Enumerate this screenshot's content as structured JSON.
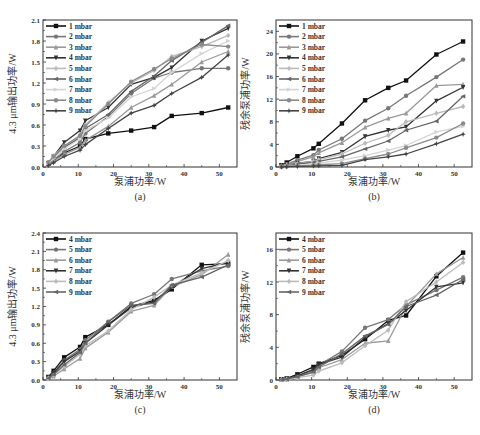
{
  "chart_data": [
    {
      "id": "a",
      "type": "line",
      "panel_label": "(a)",
      "xlabel": "泵浦功率/W",
      "ylabel": "4.3 μm输出功率/W",
      "xlim": [
        0,
        55
      ],
      "ylim": [
        0,
        2.1
      ],
      "xticks": [
        0,
        10,
        20,
        30,
        40,
        50
      ],
      "yticks": [
        0.0,
        0.3,
        0.6,
        0.9,
        1.2,
        1.5,
        1.8,
        2.1
      ],
      "ytick_labels": [
        "0.0",
        "0.3",
        "0.6",
        "0.9",
        "1.2",
        "1.5",
        "1.8",
        "2.1"
      ],
      "legend_position": "top-left",
      "x": [
        1.5,
        3,
        6,
        10.5,
        12,
        18.5,
        25,
        31.5,
        36.5,
        45,
        52.5
      ],
      "series": [
        {
          "name": "1 mbar",
          "color": "#111111",
          "marker": "square",
          "values": [
            0.05,
            0.1,
            0.2,
            0.3,
            0.4,
            0.48,
            0.52,
            0.57,
            0.73,
            0.77,
            0.85
          ]
        },
        {
          "name": "2 mbar",
          "color": "#777777",
          "marker": "circle",
          "values": [
            0.04,
            0.1,
            0.22,
            0.35,
            0.48,
            0.72,
            1.05,
            1.27,
            1.35,
            1.41,
            1.41
          ]
        },
        {
          "name": "3 mbar",
          "color": "#999999",
          "marker": "triangle",
          "values": [
            0.03,
            0.08,
            0.18,
            0.28,
            0.38,
            0.58,
            0.85,
            1.02,
            1.18,
            1.5,
            1.65
          ]
        },
        {
          "name": "4 mbar",
          "color": "#333333",
          "marker": "triangle-down",
          "values": [
            0.05,
            0.15,
            0.35,
            0.52,
            0.66,
            0.85,
            1.18,
            1.28,
            1.42,
            1.8,
            1.98
          ]
        },
        {
          "name": "5 mbar",
          "color": "#bbbbbb",
          "marker": "diamond",
          "values": [
            0.06,
            0.16,
            0.3,
            0.45,
            0.6,
            0.92,
            1.2,
            1.38,
            1.58,
            1.72,
            1.88
          ]
        },
        {
          "name": "6 mbar",
          "color": "#666666",
          "marker": "left-triangle",
          "values": [
            0.05,
            0.13,
            0.28,
            0.42,
            0.55,
            0.75,
            1.08,
            1.3,
            1.52,
            1.78,
            2.02
          ]
        },
        {
          "name": "7 mbar",
          "color": "#d4d4d4",
          "marker": "right-triangle",
          "values": [
            0.05,
            0.12,
            0.26,
            0.4,
            0.52,
            0.7,
            1.0,
            1.12,
            1.35,
            1.62,
            1.8
          ]
        },
        {
          "name": "8 mbar",
          "color": "#8a8a8a",
          "marker": "hexagon",
          "values": [
            0.07,
            0.15,
            0.3,
            0.45,
            0.58,
            0.9,
            1.22,
            1.4,
            1.55,
            1.75,
            1.72
          ]
        },
        {
          "name": "9 mbar",
          "color": "#444444",
          "marker": "star",
          "values": [
            0.02,
            0.06,
            0.15,
            0.24,
            0.32,
            0.55,
            0.77,
            0.88,
            1.05,
            1.28,
            1.6
          ]
        }
      ]
    },
    {
      "id": "b",
      "type": "line",
      "panel_label": "(b)",
      "xlabel": "泵浦功率/W",
      "ylabel": "残余泵浦功率/W",
      "xlim": [
        0,
        55
      ],
      "ylim": [
        0,
        26
      ],
      "xticks": [
        0,
        10,
        20,
        30,
        40,
        50
      ],
      "yticks": [
        0,
        4,
        8,
        12,
        16,
        20,
        24
      ],
      "ytick_labels": [
        "0",
        "4",
        "8",
        "12",
        "16",
        "20",
        "24"
      ],
      "legend_position": "top-left",
      "x": [
        1.5,
        3,
        6,
        10.5,
        12,
        18.5,
        25,
        31.5,
        36.5,
        45,
        52.5
      ],
      "series": [
        {
          "name": "1 mbar",
          "color": "#111111",
          "marker": "square",
          "values": [
            0.3,
            0.8,
            1.9,
            3.3,
            4.1,
            7.7,
            11.8,
            14.0,
            15.3,
            19.9,
            22.2
          ]
        },
        {
          "name": "2 mbar",
          "color": "#777777",
          "marker": "circle",
          "values": [
            0.2,
            0.5,
            1.2,
            2.1,
            3.0,
            5.0,
            8.2,
            10.4,
            12.6,
            15.9,
            19.0
          ]
        },
        {
          "name": "3 mbar",
          "color": "#999999",
          "marker": "triangle",
          "values": [
            0.2,
            0.4,
            1.0,
            1.8,
            2.5,
            4.3,
            7.0,
            8.6,
            9.5,
            14.4,
            14.6
          ]
        },
        {
          "name": "4 mbar",
          "color": "#333333",
          "marker": "triangle-down",
          "values": [
            0.1,
            0.3,
            0.7,
            1.0,
            1.5,
            2.6,
            5.4,
            6.5,
            7.1,
            11.7,
            14.1
          ]
        },
        {
          "name": "5 mbar",
          "color": "#bbbbbb",
          "marker": "diamond",
          "values": [
            0.1,
            0.3,
            0.6,
            1.0,
            1.3,
            2.3,
            4.2,
            5.6,
            8.0,
            9.5,
            10.7
          ]
        },
        {
          "name": "6 mbar",
          "color": "#666666",
          "marker": "left-triangle",
          "values": [
            0.1,
            0.2,
            0.5,
            0.8,
            1.0,
            1.8,
            3.2,
            4.6,
            6.5,
            8.1,
            12.5
          ]
        },
        {
          "name": "7 mbar",
          "color": "#d4d4d4",
          "marker": "right-triangle",
          "values": [
            0.05,
            0.15,
            0.3,
            0.5,
            0.7,
            1.2,
            2.0,
            3.0,
            3.8,
            6.2,
            7.2
          ]
        },
        {
          "name": "8 mbar",
          "color": "#8a8a8a",
          "marker": "hexagon",
          "values": [
            0.05,
            0.1,
            0.2,
            0.3,
            0.4,
            0.6,
            1.5,
            2.3,
            3.4,
            5.2,
            7.7
          ]
        },
        {
          "name": "9 mbar",
          "color": "#444444",
          "marker": "star",
          "values": [
            0.0,
            0.05,
            0.1,
            0.15,
            0.2,
            0.3,
            1.3,
            1.8,
            2.3,
            4.1,
            5.8
          ]
        }
      ]
    },
    {
      "id": "c",
      "type": "line",
      "panel_label": "(c)",
      "xlabel": "泵浦功率/W",
      "ylabel": "4.3 μm输出功率/W",
      "xlim": [
        0,
        55
      ],
      "ylim": [
        0,
        2.4
      ],
      "xticks": [
        0,
        10,
        20,
        30,
        40,
        50
      ],
      "yticks": [
        0.0,
        0.3,
        0.6,
        0.9,
        1.2,
        1.5,
        1.8,
        2.1,
        2.4
      ],
      "ytick_labels": [
        "0.0",
        "0.3",
        "0.6",
        "0.9",
        "1.2",
        "1.5",
        "1.8",
        "2.1",
        "2.4"
      ],
      "legend_position": "top-left",
      "x": [
        1.5,
        3,
        6,
        10.5,
        12,
        18.5,
        25,
        31.5,
        36.5,
        45,
        52.5
      ],
      "series": [
        {
          "name": "4 mbar",
          "color": "#111111",
          "marker": "square",
          "values": [
            0.05,
            0.15,
            0.37,
            0.54,
            0.7,
            0.9,
            1.2,
            1.3,
            1.48,
            1.88,
            1.9
          ]
        },
        {
          "name": "5 mbar",
          "color": "#777777",
          "marker": "circle",
          "values": [
            0.04,
            0.12,
            0.32,
            0.5,
            0.65,
            0.95,
            1.25,
            1.4,
            1.65,
            1.78,
            1.86
          ]
        },
        {
          "name": "6 mbar",
          "color": "#999999",
          "marker": "triangle",
          "values": [
            0.02,
            0.06,
            0.18,
            0.35,
            0.52,
            0.78,
            1.12,
            1.22,
            1.52,
            1.72,
            2.05
          ]
        },
        {
          "name": "7 mbar",
          "color": "#333333",
          "marker": "triangle-down",
          "values": [
            0.04,
            0.11,
            0.3,
            0.47,
            0.6,
            0.9,
            1.18,
            1.28,
            1.52,
            1.82,
            1.92
          ]
        },
        {
          "name": "8 mbar",
          "color": "#bbbbbb",
          "marker": "diamond",
          "values": [
            0.03,
            0.08,
            0.22,
            0.42,
            0.56,
            0.8,
            1.15,
            1.35,
            1.55,
            1.75,
            1.95
          ]
        },
        {
          "name": "9 mbar",
          "color": "#666666",
          "marker": "left-triangle",
          "values": [
            0.03,
            0.09,
            0.25,
            0.45,
            0.6,
            0.95,
            1.22,
            1.25,
            1.55,
            1.68,
            1.88
          ]
        }
      ]
    },
    {
      "id": "d",
      "type": "line",
      "panel_label": "(d)",
      "xlabel": "泵浦功率/W",
      "ylabel": "残余泵浦功率/W",
      "xlim": [
        0,
        55
      ],
      "ylim": [
        0,
        18
      ],
      "xticks": [
        0,
        10,
        20,
        30,
        40,
        50
      ],
      "yticks": [
        0,
        4,
        8,
        12,
        16
      ],
      "ytick_labels": [
        "0",
        "4",
        "8",
        "12",
        "16"
      ],
      "legend_position": "top-left",
      "x": [
        1.5,
        3,
        6,
        10.5,
        12,
        18.5,
        25,
        31.5,
        36.5,
        45,
        52.5
      ],
      "series": [
        {
          "name": "4 mbar",
          "color": "#111111",
          "marker": "square",
          "values": [
            0.1,
            0.2,
            0.7,
            1.6,
            2.0,
            3.0,
            5.0,
            7.3,
            7.9,
            12.7,
            15.6
          ]
        },
        {
          "name": "5 mbar",
          "color": "#777777",
          "marker": "circle",
          "values": [
            0.05,
            0.15,
            0.5,
            1.2,
            1.8,
            3.5,
            6.4,
            7.4,
            9.2,
            11.0,
            12.6
          ]
        },
        {
          "name": "6 mbar",
          "color": "#999999",
          "marker": "triangle",
          "values": [
            0.05,
            0.1,
            0.4,
            0.9,
            1.5,
            2.5,
            4.5,
            4.8,
            9.0,
            13.0,
            15.0
          ]
        },
        {
          "name": "7 mbar",
          "color": "#333333",
          "marker": "triangle-down",
          "values": [
            0.05,
            0.1,
            0.5,
            1.3,
            1.9,
            2.8,
            5.2,
            6.9,
            8.5,
            11.4,
            11.9
          ]
        },
        {
          "name": "8 mbar",
          "color": "#bbbbbb",
          "marker": "diamond",
          "values": [
            0.05,
            0.1,
            0.3,
            0.6,
            1.1,
            2.1,
            4.2,
            6.1,
            9.6,
            12.0,
            14.4
          ]
        },
        {
          "name": "9 mbar",
          "color": "#666666",
          "marker": "left-triangle",
          "values": [
            0.05,
            0.1,
            0.4,
            1.0,
            1.6,
            3.2,
            5.4,
            6.8,
            9.0,
            10.4,
            12.3
          ]
        }
      ]
    }
  ]
}
